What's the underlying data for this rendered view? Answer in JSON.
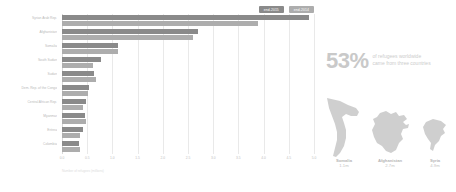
{
  "chart_data": {
    "type": "bar",
    "orientation": "horizontal",
    "title": "",
    "xlabel": "Number of refugees (millions)",
    "ylabel": "",
    "xlim": [
      0,
      5.0
    ],
    "xticks": [
      "0.0",
      "0.5",
      "1.0",
      "1.5",
      "2.0",
      "2.5",
      "3.0",
      "3.5",
      "4.0",
      "4.5",
      "5.0"
    ],
    "grid": true,
    "legend_position": "top-right",
    "categories": [
      "Syrian Arab Rep.",
      "Afghanistan",
      "Somalia",
      "South Sudan",
      "Sudan",
      "Dem. Rep. of the Congo",
      "Central African Rep.",
      "Myanmar",
      "Eritrea",
      "Colombia"
    ],
    "series": [
      {
        "name": "end-2015",
        "color": "#8a8a8a",
        "values": [
          4.9,
          2.7,
          1.12,
          0.78,
          0.63,
          0.54,
          0.47,
          0.45,
          0.41,
          0.34
        ]
      },
      {
        "name": "end-2014",
        "color": "#adadad",
        "values": [
          3.88,
          2.6,
          1.11,
          0.62,
          0.67,
          0.52,
          0.41,
          0.48,
          0.36,
          0.36
        ]
      }
    ]
  },
  "chart": {
    "legend": [
      {
        "label": "end-2015"
      },
      {
        "label": "end-2014"
      }
    ],
    "axis_title": "Number of refugees (millions)"
  },
  "infographic": {
    "stat_number": "53%",
    "stat_line1": "of refugees worldwide",
    "stat_line2": "came from three countries",
    "countries": [
      {
        "name": "Somalia",
        "value": "1.1m",
        "map_icon": "somalia-map-icon"
      },
      {
        "name": "Afghanistan",
        "value": "2.7m",
        "map_icon": "afghanistan-map-icon"
      },
      {
        "name": "Syria",
        "value": "4.9m",
        "map_icon": "syria-map-icon"
      }
    ]
  },
  "colors": {
    "series_2015": "#8a8a8a",
    "series_2014": "#adadad",
    "map_fill": "#cfcfcf",
    "text_muted": "#c2c2c2"
  }
}
